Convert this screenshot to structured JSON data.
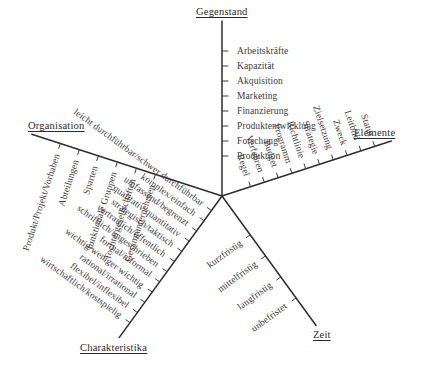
{
  "diagram": {
    "type": "radial-spoke-diagram",
    "background_color": "#ffffff",
    "line_color": "#2e2e2e",
    "text_color": "#3a3a3a",
    "center": {
      "x": 222,
      "y": 196
    },
    "axes": [
      {
        "id": "gegenstand",
        "title": "Gegenstand",
        "direction": "up",
        "angle_deg": -90,
        "label_orientation": "horizontal",
        "items": [
          "Produktion",
          "Forschung",
          "Produktentwicklung",
          "Finanzierung",
          "Marketing",
          "Akquisition",
          "Kapazität",
          "Arbeitskräfte"
        ]
      },
      {
        "id": "organisation",
        "title": "Organisation",
        "direction": "upper-left",
        "angle_deg": 198,
        "label_orientation": "rotated",
        "items": [
          "Gesamtunternehmen",
          "Tochtergesellschaften",
          "funktionale Gruppen",
          "Sparten",
          "Abteilungen",
          "Produkt/Projekt/Vorhaben"
        ]
      },
      {
        "id": "elemente",
        "title": "Elemente",
        "direction": "upper-right",
        "angle_deg": -18,
        "label_orientation": "rotated",
        "items": [
          "Regel",
          "Verfahren",
          "Budget",
          "Programm",
          "Richtlinie",
          "Strategie",
          "Zielsetzung",
          "Zweck",
          "Leitbild",
          "Statut"
        ]
      },
      {
        "id": "zeit",
        "title": "Zeit",
        "direction": "lower-right",
        "angle_deg": 54,
        "label_orientation": "rotated",
        "items": [
          "kurzfristig",
          "mittelfristig",
          "langfristig",
          "unbefristet"
        ]
      },
      {
        "id": "charakteristika",
        "title": "Charakteristika",
        "direction": "lower-left",
        "angle_deg": 126,
        "label_orientation": "rotated",
        "items": [
          "leicht durchführbar/schwer durchführbar",
          "komplex/einfach",
          "umfassend/begrenzt",
          "qualitativ/quantitativ",
          "strategisch/taktisch",
          "vertraulich/öffentlich",
          "schriftlich/ungeschrieben",
          "formal/informal",
          "wichtig/weniger wichtig",
          "rational/irrational",
          "flexibel/inflexibel",
          "wirtschaftlich/kostspielig"
        ]
      }
    ]
  }
}
